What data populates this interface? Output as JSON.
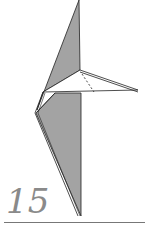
{
  "diagram": {
    "step_number": "15",
    "colors": {
      "paper_colored": "#a3a3a3",
      "paper_white": "#ffffff",
      "line": "#222222",
      "step_number": "#8a8a8a",
      "baseline": "#777777"
    }
  }
}
